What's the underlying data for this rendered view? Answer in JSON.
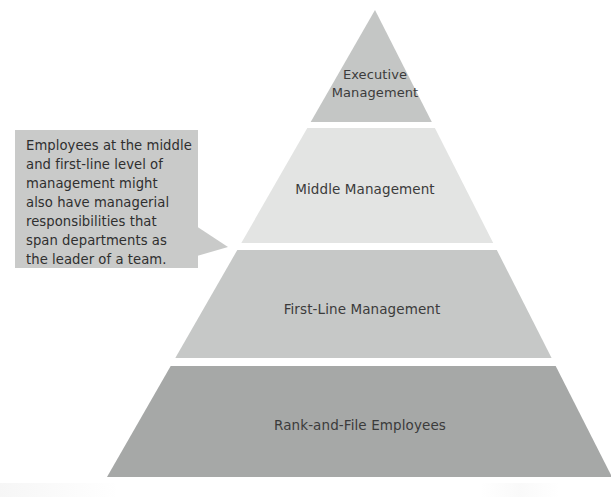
{
  "diagram": {
    "type": "pyramid",
    "background_color": "#ffffff",
    "apex": {
      "x": 375,
      "y": 10
    },
    "base": {
      "left_x": 107,
      "right_x": 612,
      "y": 477
    },
    "levels": [
      {
        "id": "executive",
        "label": "Executive Management",
        "label_lines": [
          "Executive",
          "Management"
        ],
        "rank": 1,
        "color": "#c4c6c5",
        "top_y": 10,
        "bottom_y": 122,
        "label_center_x": 375,
        "label_center_y": 83
      },
      {
        "id": "middle",
        "label": "Middle Management",
        "label_lines": [
          "Middle Management"
        ],
        "rank": 2,
        "color": "#e3e4e3",
        "top_y": 128,
        "bottom_y": 243,
        "label_center_x": 365,
        "label_center_y": 190
      },
      {
        "id": "first-line",
        "label": "First-Line Management",
        "label_lines": [
          "First-Line Management"
        ],
        "rank": 3,
        "color": "#c6c8c7",
        "top_y": 250,
        "bottom_y": 358,
        "label_center_x": 362,
        "label_center_y": 309
      },
      {
        "id": "rank-and-file",
        "label": "Rank-and-File Employees",
        "label_lines": [
          "Rank-and-File Employees"
        ],
        "rank": 4,
        "color": "#a6a8a7",
        "top_y": 366,
        "bottom_y": 477,
        "label_center_x": 360,
        "label_center_y": 425
      }
    ],
    "separator_color": "#ffffff"
  },
  "callout": {
    "id": "middle-first-line-note",
    "fill_color": "#c9cac9",
    "text_color": "#2f2f2f",
    "box": {
      "x": 15,
      "y": 130,
      "width": 183,
      "height": 138
    },
    "pointer_tip": {
      "x": 228,
      "y": 247
    },
    "text": "Employees at the middle and first-line level of management might also have managerial responsibilities that span departments as the leader of a team.",
    "lines": [
      "Employees at the middle",
      "and first-line level of",
      "management might",
      "also have managerial",
      "responsibilities that",
      "span departments as",
      "the leader of a team."
    ]
  }
}
